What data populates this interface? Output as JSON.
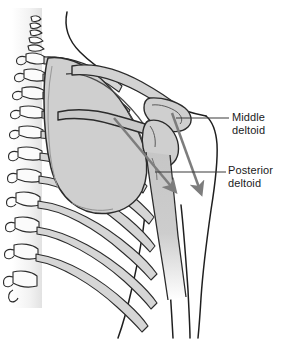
{
  "figure": {
    "background_color": "#ffffff",
    "width": 281,
    "height": 341
  },
  "labels": [
    {
      "id": "middle-deltoid",
      "line1": "Middle",
      "line2": "deltoid",
      "leader_line_color": "#3a3a3a"
    },
    {
      "id": "posterior-deltoid",
      "line1": "Posterior",
      "line2": "deltoid",
      "leader_line_color": "#3a3a3a"
    }
  ],
  "arrows": [
    {
      "id": "middle-deltoid-arrow",
      "description": "Arrow running inferolaterally from acromion down the humerus",
      "color": "#7d7d7d"
    },
    {
      "id": "posterior-deltoid-arrow",
      "description": "Arrow running inferolaterally from scapular spine toward arm",
      "color": "#7d7d7d"
    }
  ],
  "anatomy": {
    "structures": [
      {
        "id": "vertebral-column",
        "name": "Vertebral column",
        "fill": "#ffffff",
        "stroke": "#2b2b2b"
      },
      {
        "id": "ribs",
        "name": "Ribs",
        "fill": "#d6d6d6",
        "stroke": "#2b2b2b"
      },
      {
        "id": "scapula",
        "name": "Scapula",
        "fill": "#cfcfcf",
        "stroke": "#2b2b2b"
      },
      {
        "id": "scapular-spine",
        "name": "Spine of scapula",
        "fill": "#c9c9c9",
        "stroke": "#2b2b2b"
      },
      {
        "id": "acromion",
        "name": "Acromion",
        "fill": "#cfcfcf",
        "stroke": "#2b2b2b"
      },
      {
        "id": "clavicle",
        "name": "Clavicle",
        "fill": "#d2d2d2",
        "stroke": "#2b2b2b"
      },
      {
        "id": "humerus",
        "name": "Humerus",
        "fill": "#cccccc",
        "stroke": "#2b2b2b"
      },
      {
        "id": "body-outline",
        "name": "Body outline",
        "fill": "none",
        "stroke": "#1f1f1f"
      }
    ],
    "outline_color": "#222222",
    "bone_fill": "#cfcfcf"
  }
}
